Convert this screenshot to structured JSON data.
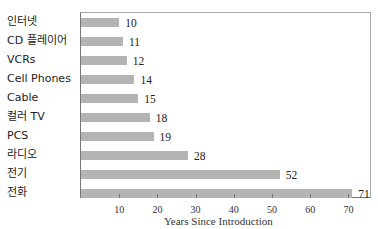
{
  "chart_data": {
    "type": "bar",
    "orientation": "horizontal",
    "title": "",
    "xlabel": "Years Since Introduction",
    "ylabel": "",
    "categories": [
      "인터넷",
      "CD 플레이어",
      "VCRs",
      "Cell Phones",
      "Cable",
      "컬러 TV",
      "PCS",
      "라디오",
      "전기",
      "전화"
    ],
    "values": [
      10,
      11,
      12,
      14,
      15,
      18,
      19,
      28,
      52,
      71
    ],
    "xlim": [
      0,
      75
    ],
    "xticks": [
      10,
      20,
      30,
      40,
      50,
      60,
      70
    ],
    "grid": false,
    "legend": null,
    "bar_color": "#b4b4b4"
  }
}
